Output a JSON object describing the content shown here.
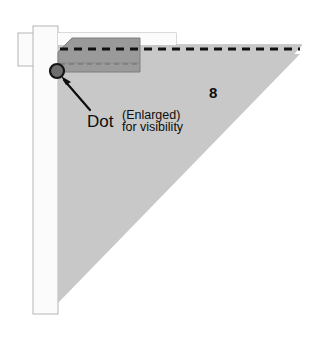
{
  "figure": {
    "title_visible": false,
    "labels": {
      "dot": "Dot",
      "enlarged": "(Enlarged)",
      "for_visibility": "for visibility",
      "dimension_8": "8"
    },
    "colors": {
      "triangle_fill": "#c8c8c8",
      "triangle_edge": "#9a9a9a",
      "dark_block_fill": "#9a9a9a",
      "dark_block_edge": "#7c7c7c",
      "band_fill": "#fbfbfb",
      "band_edge": "#b5b5b5",
      "dashed_line": "#111111",
      "dot_fill": "#6f6f6f",
      "dot_edge": "#151515",
      "arrow": "#0d0d0d",
      "text": "#0d0d0d",
      "background": "#ffffff"
    },
    "geometry": {
      "triangle_top_left_x": 45,
      "triangle_top_y": 45,
      "triangle_right_tip_x": 302,
      "triangle_bottom_tip_y": 312,
      "dot_center_x": 57,
      "dot_center_y": 71,
      "dot_radius": 7,
      "dashed_line_y": 49,
      "dashed_line_x_start": 60,
      "dashed_line_x_end": 300
    },
    "annotations": {
      "arrow_from": "Dot label",
      "arrow_to": "dot marker"
    }
  }
}
